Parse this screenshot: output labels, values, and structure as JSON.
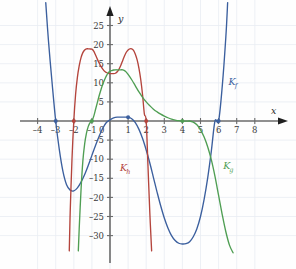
{
  "figure": {
    "title": "",
    "background_color": "#fefefe",
    "grid_color": "#e8ecf2",
    "axis_color": "#6b6b6b",
    "tick_text_color": "#3a3a3a"
  },
  "axes": {
    "x_axis_label": "x",
    "y_axis_label": "y",
    "x_ticks": [
      -4,
      -3,
      -2,
      -1,
      0,
      1,
      2,
      3,
      4,
      5,
      6,
      7,
      8
    ],
    "x_tick_labels": [
      "–4",
      "–3",
      "–2",
      "–1",
      "0",
      "1",
      "2",
      "3",
      "4",
      "5",
      "6",
      "7",
      "8"
    ],
    "y_ticks": [
      -30,
      -25,
      -20,
      -15,
      -10,
      -5,
      5,
      10,
      15,
      20,
      25
    ],
    "y_tick_labels": [
      "–30",
      "–25",
      "–20",
      "–15",
      "–10",
      "–5",
      "5",
      "10",
      "15",
      "20",
      "25"
    ],
    "xlim": [
      -4.9,
      8.7
    ],
    "ylim": [
      -34.5,
      28.0
    ],
    "grid": true
  },
  "curves": [
    {
      "id": "Kf",
      "label": "K",
      "label_sub": "f",
      "color": "#3b5f9e",
      "label_x": 6.55,
      "label_y": 9.5
    },
    {
      "id": "Kh",
      "label": "K",
      "label_sub": "h",
      "color": "#b4443c",
      "label_x": 0.55,
      "label_y": -13.0
    },
    {
      "id": "Kg",
      "label": "K",
      "label_sub": "g",
      "color": "#4f9e53",
      "label_x": 6.25,
      "label_y": -12.5
    }
  ],
  "marked_points": [
    {
      "x": -3,
      "y": 0,
      "color": "#3b5f9e",
      "curve": "Kf"
    },
    {
      "x": 1,
      "y": 1,
      "color": "#3b5f9e",
      "curve": "Kf"
    },
    {
      "x": 6,
      "y": 0,
      "color": "#3b5f9e",
      "curve": "Kf"
    },
    {
      "x": -2,
      "y": 0,
      "color": "#b4443c",
      "curve": "Kh"
    },
    {
      "x": 2,
      "y": 0,
      "color": "#b4443c",
      "curve": "Kh"
    },
    {
      "x": -1,
      "y": 0,
      "color": "#4f9e53",
      "curve": "Kg"
    },
    {
      "x": 4,
      "y": 0,
      "color": "#4f9e53",
      "curve": "Kg"
    }
  ],
  "chart_data": {
    "type": "line",
    "title": "",
    "xlabel": "x",
    "ylabel": "y",
    "xlim": [
      -4.9,
      8.7
    ],
    "ylim": [
      -34.5,
      28.0
    ],
    "grid": true,
    "legend_position": "inline-curve-labels",
    "series": [
      {
        "name": "Kf",
        "label": "K_f",
        "color": "#3b5f9e",
        "roots": [
          -3,
          6
        ],
        "touch_points": [],
        "local_extrema": [
          {
            "x": -2.0,
            "y": -18.3,
            "kind": "min"
          },
          {
            "x": 1.0,
            "y": 1.0,
            "kind": "max"
          },
          {
            "x": 4.55,
            "y": -32.2,
            "kind": "min"
          }
        ],
        "x": [
          -3.55,
          -3.4,
          -3.2,
          -3.0,
          -2.8,
          -2.6,
          -2.4,
          -2.2,
          -2.0,
          -1.8,
          -1.6,
          -1.4,
          -1.2,
          -1.0,
          -0.8,
          -0.6,
          -0.4,
          -0.2,
          0.0,
          0.2,
          0.4,
          0.6,
          0.8,
          1.0,
          1.2,
          1.4,
          1.6,
          1.8,
          2.0,
          2.2,
          2.4,
          2.6,
          2.8,
          3.0,
          3.2,
          3.4,
          3.6,
          3.8,
          4.0,
          4.2,
          4.4,
          4.6,
          4.8,
          5.0,
          5.2,
          5.4,
          5.6,
          5.8,
          6.0,
          6.2,
          6.4,
          6.5
        ],
        "y": [
          31.0,
          21.0,
          10.0,
          0.0,
          -7.5,
          -13.2,
          -16.7,
          -18.1,
          -18.3,
          -17.5,
          -16.0,
          -14.0,
          -11.6,
          -9.0,
          -6.4,
          -4.0,
          -1.9,
          -0.4,
          0.3,
          0.8,
          1.0,
          1.0,
          1.0,
          1.0,
          0.6,
          -0.4,
          -2.2,
          -4.6,
          -7.6,
          -11.0,
          -14.8,
          -18.6,
          -22.2,
          -25.4,
          -28.0,
          -30.0,
          -31.3,
          -32.0,
          -32.2,
          -32.1,
          -31.6,
          -30.3,
          -28.2,
          -25.0,
          -20.5,
          -14.8,
          -7.8,
          0.0,
          0.0,
          9.0,
          22.0,
          31.0
        ]
      },
      {
        "name": "Kh",
        "label": "K_h",
        "color": "#b4443c",
        "roots": [
          -2,
          2
        ],
        "local_extrema": [
          {
            "x": -1.05,
            "y": 18.8,
            "kind": "max"
          },
          {
            "x": 0.25,
            "y": 12.4,
            "kind": "min"
          },
          {
            "x": 1.15,
            "y": 18.9,
            "kind": "max"
          }
        ],
        "x": [
          -2.25,
          -2.2,
          -2.1,
          -2.0,
          -1.9,
          -1.8,
          -1.7,
          -1.6,
          -1.5,
          -1.4,
          -1.3,
          -1.2,
          -1.1,
          -1.0,
          -0.9,
          -0.8,
          -0.7,
          -0.6,
          -0.5,
          -0.4,
          -0.3,
          -0.2,
          -0.1,
          0.0,
          0.1,
          0.2,
          0.3,
          0.4,
          0.5,
          0.6,
          0.7,
          0.8,
          0.9,
          1.0,
          1.1,
          1.2,
          1.3,
          1.4,
          1.5,
          1.6,
          1.7,
          1.8,
          1.9,
          2.0,
          2.1,
          2.2,
          2.3
        ],
        "y": [
          -34.0,
          -24.0,
          -10.0,
          0.0,
          7.0,
          11.5,
          14.5,
          16.6,
          17.9,
          18.6,
          18.9,
          18.9,
          18.85,
          18.8,
          18.3,
          17.3,
          16.2,
          15.2,
          14.3,
          13.6,
          13.0,
          12.7,
          12.5,
          12.4,
          12.4,
          12.4,
          12.5,
          12.9,
          13.6,
          14.6,
          15.8,
          17.0,
          18.0,
          18.6,
          18.9,
          18.9,
          18.5,
          17.5,
          16.0,
          13.8,
          10.8,
          6.8,
          1.8,
          0.0,
          -12.0,
          -24.0,
          -34.0
        ]
      },
      {
        "name": "Kg",
        "label": "K_g",
        "color": "#4f9e53",
        "roots": [
          -1
        ],
        "touch_points": [
          4
        ],
        "local_extrema": [
          {
            "x": 0.65,
            "y": 13.4,
            "kind": "max"
          },
          {
            "x": 4.1,
            "y": -0.05,
            "kind": "min"
          }
        ],
        "x": [
          -1.75,
          -1.7,
          -1.6,
          -1.5,
          -1.4,
          -1.3,
          -1.2,
          -1.1,
          -1.0,
          -0.9,
          -0.8,
          -0.7,
          -0.6,
          -0.5,
          -0.4,
          -0.3,
          -0.2,
          -0.1,
          0.0,
          0.1,
          0.2,
          0.3,
          0.4,
          0.5,
          0.6,
          0.7,
          0.8,
          0.9,
          1.0,
          1.2,
          1.4,
          1.6,
          1.8,
          2.0,
          2.2,
          2.4,
          2.6,
          2.8,
          3.0,
          3.2,
          3.4,
          3.6,
          3.8,
          4.0,
          4.2,
          4.4,
          4.6,
          4.8,
          5.0,
          5.2,
          5.4,
          5.6,
          5.8,
          6.0,
          6.2,
          6.4,
          6.6,
          6.8
        ],
        "y": [
          -34.0,
          -28.0,
          -18.0,
          -10.5,
          -6.0,
          -3.2,
          -1.4,
          -0.4,
          0.0,
          1.2,
          3.0,
          4.8,
          6.6,
          8.2,
          9.6,
          10.8,
          11.8,
          12.6,
          13.0,
          13.2,
          13.35,
          13.4,
          13.4,
          13.4,
          13.4,
          13.4,
          13.2,
          12.8,
          12.2,
          10.8,
          9.2,
          7.6,
          6.2,
          5.0,
          4.0,
          3.1,
          2.4,
          1.8,
          1.3,
          0.85,
          0.5,
          0.25,
          0.08,
          0.0,
          -0.05,
          0.0,
          -0.3,
          -1.0,
          -2.3,
          -4.2,
          -6.8,
          -10.2,
          -14.5,
          -19.5,
          -24.5,
          -29.0,
          -32.5,
          -34.5
        ]
      }
    ]
  }
}
